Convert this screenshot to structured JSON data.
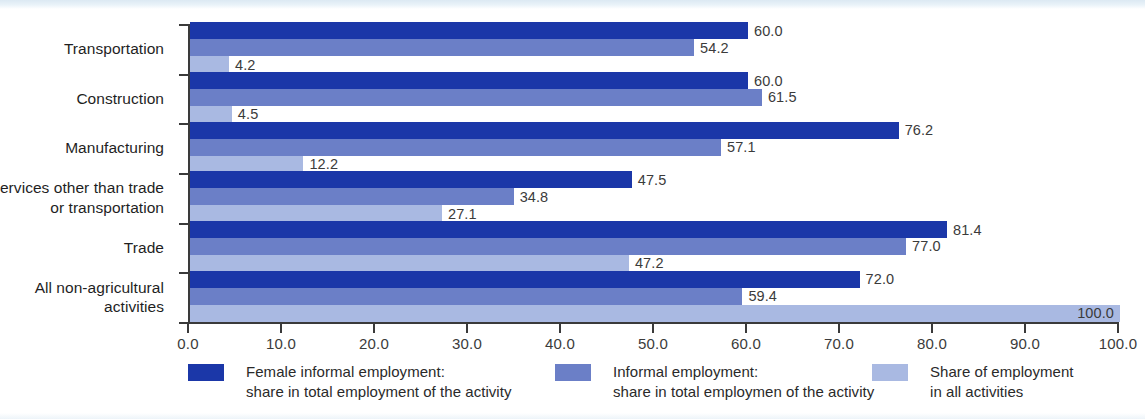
{
  "chart_data": {
    "type": "bar",
    "orientation": "horizontal",
    "title": "",
    "subtitle": "",
    "xlabel": "",
    "ylabel": "",
    "xlim": [
      0.0,
      100.0
    ],
    "xticks": [
      "0.0",
      "10.0",
      "20.0",
      "30.0",
      "40.0",
      "50.0",
      "60.0",
      "70.0",
      "80.0",
      "90.0",
      "100.0"
    ],
    "grid": false,
    "legend_position": "bottom",
    "categories": [
      "Transportation",
      "Construction",
      "Manufacturing",
      "Services other than trade\nor transportation",
      "Trade",
      "All non-agricultural\nactivities"
    ],
    "category_lines": [
      [
        "Transportation"
      ],
      [
        "Construction"
      ],
      [
        "Manufacturing"
      ],
      [
        "Services other than trade",
        "or transportation"
      ],
      [
        "Trade"
      ],
      [
        "All non-agricultural",
        "activities"
      ]
    ],
    "series": [
      {
        "name": "Female informal employment: share in total employment of the activity",
        "color": "#1b37a8",
        "values": [
          60.0,
          60.0,
          76.2,
          47.5,
          81.4,
          72.0
        ],
        "labels": [
          "60.0",
          "60.0",
          "76.2",
          "47.5",
          "81.4",
          "72.0"
        ]
      },
      {
        "name": "Informal employment: share in total employmen of the activity",
        "color": "#6b7fc7",
        "values": [
          54.2,
          61.5,
          57.1,
          34.8,
          77.0,
          59.4
        ],
        "labels": [
          "54.2",
          "61.5",
          "57.1",
          "34.8",
          "77.0",
          "59.4"
        ]
      },
      {
        "name": "Share of employment in all activities",
        "color": "#a9b9e2",
        "values": [
          4.2,
          4.5,
          12.2,
          27.1,
          47.2,
          100.0
        ],
        "labels": [
          "4.2",
          "4.5",
          "12.2",
          "27.1",
          "47.2",
          "100.0"
        ]
      }
    ]
  },
  "legend": {
    "items": [
      {
        "line1": "Female informal employment:",
        "line2": "share in total employment of the activity",
        "color": "#1b37a8"
      },
      {
        "line1": "Informal employment:",
        "line2": "share in total employmen of the activity",
        "color": "#6b7fc7"
      },
      {
        "line1": "Share of employment",
        "line2": "in all activities",
        "color": "#a9b9e2"
      }
    ]
  },
  "axis": {
    "x_tick_labels": [
      "0.0",
      "10.0",
      "20.0",
      "30.0",
      "40.0",
      "50.0",
      "60.0",
      "70.0",
      "80.0",
      "90.0",
      "100.0"
    ]
  }
}
